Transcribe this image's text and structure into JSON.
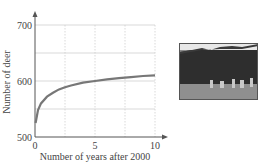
{
  "chart_data": {
    "type": "line",
    "title": "",
    "xlabel": "Number of years after 2000",
    "ylabel": "Number of deer",
    "xlim": [
      0,
      10
    ],
    "ylim": [
      500,
      700
    ],
    "x_ticks": [
      "0",
      "5",
      "10"
    ],
    "y_ticks": [
      "500",
      "600",
      "700"
    ],
    "grid": true,
    "grid_x": [
      2.5,
      5,
      7.5,
      10
    ],
    "grid_y": [
      550,
      600,
      650,
      700
    ],
    "series": [
      {
        "name": "Deer population",
        "x": [
          0.05,
          0.25,
          0.5,
          1,
          1.5,
          2,
          2.5,
          3,
          4,
          5,
          6,
          7,
          7.5,
          8,
          9,
          10
        ],
        "values": [
          525,
          548,
          560,
          572,
          579,
          585,
          589,
          592,
          597,
          600,
          603,
          605,
          606,
          607,
          609,
          610
        ]
      }
    ],
    "legend": "none"
  },
  "photo": {
    "description": "deer-in-field-photo"
  }
}
